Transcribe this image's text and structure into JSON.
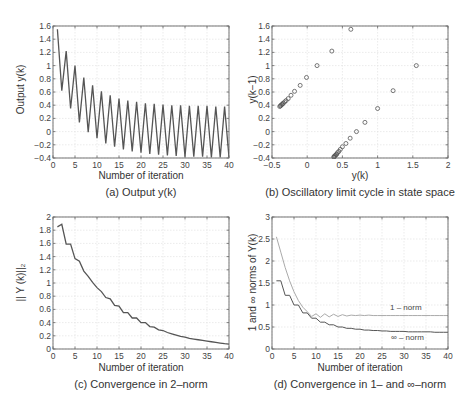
{
  "figure": {
    "panels": [
      {
        "caption": "(a) Output y(k)",
        "xlabel": "Number of iteration",
        "ylabel": "Output y(k)"
      },
      {
        "caption": "(b) Oscillatory limit cycle in state space",
        "xlabel": "y(k)",
        "ylabel": "y(k−1)"
      },
      {
        "caption": "(c) Convergence in 2–norm",
        "xlabel": "Number of iteration",
        "ylabel": "|| Y (k)||₂"
      },
      {
        "caption": "(d) Convergence in 1– and ∞–norm",
        "xlabel": "Number of iteration",
        "ylabel": "1 and ∞ norms of Y(k)",
        "legend": [
          "1 – norm",
          "∞ – norm"
        ]
      }
    ],
    "colors": {
      "line": "#555555",
      "light_line": "#aaaaaa",
      "grid": "#e3e3e3",
      "axis": "#666666"
    }
  },
  "chart_data": [
    {
      "type": "line",
      "title": "(a) Output y(k)",
      "xlabel": "Number of iteration",
      "ylabel": "Output y(k)",
      "xlim": [
        0,
        40
      ],
      "ylim": [
        -0.4,
        1.6
      ],
      "xticks": [
        0,
        5,
        10,
        15,
        20,
        25,
        30,
        35,
        40
      ],
      "yticks": [
        -0.4,
        -0.2,
        0,
        0.2,
        0.4,
        0.6,
        0.8,
        1,
        1.2,
        1.4,
        1.6
      ],
      "grid": true,
      "x": [
        1,
        2,
        3,
        4,
        5,
        6,
        7,
        8,
        9,
        10,
        11,
        12,
        13,
        14,
        15,
        16,
        17,
        18,
        19,
        20,
        21,
        22,
        23,
        24,
        25,
        26,
        27,
        28,
        29,
        30,
        31,
        32,
        33,
        34,
        35,
        36,
        37,
        38,
        39,
        40
      ],
      "values": [
        1.55,
        0.62,
        1.22,
        0.35,
        1.0,
        0.14,
        0.82,
        -0.01,
        0.7,
        -0.1,
        0.61,
        -0.18,
        0.55,
        -0.23,
        0.5,
        -0.27,
        0.47,
        -0.3,
        0.45,
        -0.32,
        0.43,
        -0.34,
        0.42,
        -0.35,
        0.41,
        -0.36,
        0.4,
        -0.37,
        0.4,
        -0.38,
        0.39,
        -0.38,
        0.39,
        -0.38,
        0.39,
        -0.39,
        0.38,
        -0.39,
        0.38,
        -0.39
      ]
    },
    {
      "type": "scatter",
      "title": "(b) Oscillatory limit cycle in state space",
      "xlabel": "y(k)",
      "ylabel": "y(k−1)",
      "xlim": [
        -0.5,
        2
      ],
      "ylim": [
        -0.4,
        1.6
      ],
      "xticks": [
        -0.5,
        0,
        0.5,
        1,
        1.5,
        2
      ],
      "yticks": [
        -0.4,
        -0.2,
        0,
        0.2,
        0.4,
        0.6,
        0.8,
        1,
        1.2,
        1.4,
        1.6
      ],
      "grid": true,
      "marker": "circle",
      "points": [
        [
          0.62,
          1.55
        ],
        [
          0.35,
          1.22
        ],
        [
          0.14,
          1.0
        ],
        [
          -0.01,
          0.82
        ],
        [
          -0.1,
          0.7
        ],
        [
          -0.18,
          0.61
        ],
        [
          -0.23,
          0.55
        ],
        [
          -0.27,
          0.5
        ],
        [
          -0.3,
          0.47
        ],
        [
          -0.32,
          0.45
        ],
        [
          -0.34,
          0.43
        ],
        [
          -0.35,
          0.42
        ],
        [
          -0.36,
          0.41
        ],
        [
          -0.37,
          0.4
        ],
        [
          -0.38,
          0.39
        ],
        [
          -0.39,
          0.38
        ],
        [
          1.55,
          1.0
        ],
        [
          1.22,
          0.62
        ],
        [
          1.0,
          0.35
        ],
        [
          0.82,
          0.14
        ],
        [
          0.7,
          0.0
        ],
        [
          0.61,
          -0.1
        ],
        [
          0.55,
          -0.18
        ],
        [
          0.5,
          -0.23
        ],
        [
          0.47,
          -0.27
        ],
        [
          0.45,
          -0.3
        ],
        [
          0.43,
          -0.32
        ],
        [
          0.42,
          -0.34
        ],
        [
          0.41,
          -0.35
        ],
        [
          0.4,
          -0.36
        ],
        [
          0.39,
          -0.37
        ],
        [
          0.38,
          -0.38
        ],
        [
          0.38,
          -0.39
        ]
      ]
    },
    {
      "type": "line",
      "title": "(c) Convergence in 2–norm",
      "xlabel": "Number of iteration",
      "ylabel": "|| Y (k)||₂",
      "xlim": [
        0,
        40
      ],
      "ylim": [
        0,
        2
      ],
      "xticks": [
        0,
        5,
        10,
        15,
        20,
        25,
        30,
        35,
        40
      ],
      "yticks": [
        0,
        0.2,
        0.4,
        0.6,
        0.8,
        1,
        1.2,
        1.4,
        1.6,
        1.8,
        2
      ],
      "grid": true,
      "x": [
        1,
        2,
        3,
        4,
        5,
        6,
        7,
        8,
        9,
        10,
        11,
        12,
        13,
        14,
        15,
        16,
        17,
        18,
        19,
        20,
        21,
        22,
        23,
        24,
        25,
        26,
        27,
        28,
        29,
        30,
        31,
        32,
        33,
        34,
        35,
        36,
        37,
        38,
        39,
        40
      ],
      "values": [
        1.85,
        1.89,
        1.59,
        1.59,
        1.37,
        1.33,
        1.18,
        1.1,
        1.01,
        0.93,
        0.87,
        0.78,
        0.76,
        0.66,
        0.65,
        0.55,
        0.55,
        0.47,
        0.47,
        0.4,
        0.4,
        0.34,
        0.33,
        0.29,
        0.28,
        0.25,
        0.23,
        0.21,
        0.19,
        0.18,
        0.16,
        0.15,
        0.14,
        0.13,
        0.12,
        0.11,
        0.1,
        0.09,
        0.08,
        0.075
      ]
    },
    {
      "type": "line",
      "title": "(d) Convergence in 1– and ∞–norm",
      "xlabel": "Number of iteration",
      "ylabel": "1 and ∞ norms of Y(k)",
      "xlim": [
        0,
        40
      ],
      "ylim": [
        0,
        3
      ],
      "xticks": [
        0,
        5,
        10,
        15,
        20,
        25,
        30,
        35,
        40
      ],
      "yticks": [
        0,
        0.5,
        1,
        1.5,
        2,
        2.5,
        3
      ],
      "grid": true,
      "x": [
        1,
        2,
        3,
        4,
        5,
        6,
        7,
        8,
        9,
        10,
        11,
        12,
        13,
        14,
        15,
        16,
        17,
        18,
        19,
        20,
        21,
        22,
        23,
        24,
        25,
        26,
        27,
        28,
        29,
        30,
        31,
        32,
        33,
        34,
        35,
        36,
        37,
        38,
        39,
        40
      ],
      "series": [
        {
          "name": "1 – norm",
          "values": [
            2.55,
            2.2,
            1.85,
            1.55,
            1.3,
            1.1,
            0.95,
            0.85,
            0.74,
            0.8,
            0.72,
            0.8,
            0.73,
            0.79,
            0.74,
            0.78,
            0.75,
            0.77,
            0.76,
            0.77,
            0.76,
            0.77,
            0.76,
            0.76,
            0.76,
            0.76,
            0.76,
            0.76,
            0.76,
            0.76,
            0.76,
            0.76,
            0.76,
            0.76,
            0.76,
            0.76,
            0.76,
            0.76,
            0.76,
            0.76
          ]
        },
        {
          "name": "∞ – norm",
          "values": [
            1.55,
            1.55,
            1.22,
            1.22,
            1.0,
            1.0,
            0.82,
            0.82,
            0.7,
            0.7,
            0.61,
            0.61,
            0.55,
            0.55,
            0.5,
            0.5,
            0.47,
            0.47,
            0.45,
            0.45,
            0.43,
            0.43,
            0.42,
            0.42,
            0.41,
            0.41,
            0.4,
            0.4,
            0.4,
            0.4,
            0.39,
            0.39,
            0.39,
            0.39,
            0.39,
            0.39,
            0.38,
            0.38,
            0.38,
            0.38
          ]
        }
      ],
      "annotations": [
        {
          "text": "1 – norm",
          "x": 27,
          "y": 0.95
        },
        {
          "text": "∞ – norm",
          "x": 27,
          "y": 0.25
        }
      ]
    }
  ]
}
